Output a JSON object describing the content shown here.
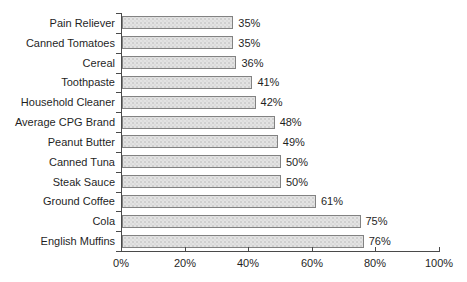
{
  "chart_data": {
    "type": "bar",
    "orientation": "horizontal",
    "title": "",
    "xlabel": "",
    "ylabel": "",
    "categories": [
      "Pain Reliever",
      "Canned Tomatoes",
      "Cereal",
      "Toothpaste",
      "Household Cleaner",
      "Average CPG Brand",
      "Peanut Butter",
      "Canned Tuna",
      "Steak Sauce",
      "Ground Coffee",
      "Cola",
      "English Muffins"
    ],
    "values": [
      35,
      35,
      36,
      41,
      42,
      48,
      49,
      50,
      50,
      61,
      75,
      76
    ],
    "value_labels": [
      "35%",
      "35%",
      "36%",
      "41%",
      "42%",
      "48%",
      "49%",
      "50%",
      "50%",
      "61%",
      "75%",
      "76%"
    ],
    "xlim": [
      0,
      100
    ],
    "x_tick_values": [
      0,
      20,
      40,
      60,
      80,
      100
    ],
    "x_tick_labels": [
      "0%",
      "20%",
      "40%",
      "60%",
      "80%",
      "100%"
    ],
    "grid": false,
    "legend": null,
    "colors": {
      "background": "#ffffff",
      "bar_fill": "#e3e3e3",
      "bar_border": "#828282",
      "axis": "#4a4a4a",
      "text": "#1f1f1f"
    }
  }
}
